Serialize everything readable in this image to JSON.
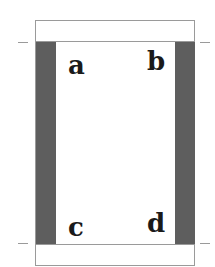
{
  "diagram": {
    "letters": {
      "top_left": "a",
      "top_right": "b",
      "bottom_left": "c",
      "bottom_right": "d"
    },
    "colors": {
      "strip": "#5e5e5e",
      "border": "#9a9a9a",
      "text": "#1a1a1a",
      "background": "#ffffff"
    }
  }
}
